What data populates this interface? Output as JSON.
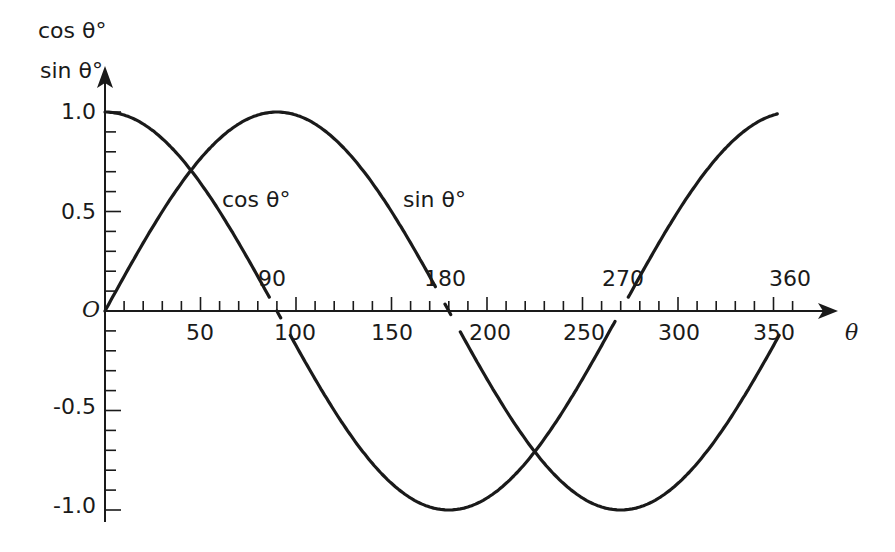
{
  "chart_data": {
    "type": "line",
    "title": "",
    "xlabel": "θ",
    "ylabel_lines": [
      "cos θ°",
      "sin θ°"
    ],
    "xlim": [
      0,
      360
    ],
    "ylim": [
      -1.0,
      1.0
    ],
    "grid": false,
    "legend": "inline curve labels",
    "x_ticks_below": [
      "50",
      "100",
      "150",
      "200",
      "250",
      "300",
      "350"
    ],
    "x_ticks_above": [
      "90",
      "180",
      "270",
      "360"
    ],
    "y_ticks": [
      "1.0",
      "0.5",
      "0",
      "-0.5",
      "-1.0"
    ],
    "origin_label": "O",
    "series": [
      {
        "name": "cos θ°",
        "x": [
          0,
          30,
          45,
          60,
          90,
          120,
          135,
          150,
          180,
          210,
          225,
          240,
          270,
          300,
          315,
          330,
          360
        ],
        "y": [
          1.0,
          0.866,
          0.707,
          0.5,
          0.0,
          -0.5,
          -0.707,
          -0.866,
          -1.0,
          -0.866,
          -0.707,
          -0.5,
          0.0,
          0.5,
          0.707,
          0.866,
          1.0
        ]
      },
      {
        "name": "sin θ°",
        "x": [
          0,
          30,
          45,
          60,
          90,
          120,
          135,
          150,
          180,
          210,
          225,
          240,
          270,
          300,
          315,
          330,
          360
        ],
        "y": [
          0.0,
          0.5,
          0.707,
          0.866,
          1.0,
          0.866,
          0.707,
          0.5,
          0.0,
          -0.5,
          -0.707,
          -0.866,
          -1.0,
          -0.866,
          -0.707,
          -0.5,
          0.0
        ]
      }
    ]
  },
  "labels": {
    "y_axis_line1": "cos θ°",
    "y_axis_line2": "sin θ°",
    "x_axis": "θ",
    "origin": "O",
    "cos_curve": "cos θ°",
    "sin_curve": "sin θ°",
    "y_ticks": {
      "p10": "1.0",
      "p05": "0.5",
      "m05": "-0.5",
      "m10": "-1.0"
    },
    "x_below": {
      "t50": "50",
      "t100": "100",
      "t150": "150",
      "t200": "200",
      "t250": "250",
      "t300": "300",
      "t350": "350"
    },
    "x_above": {
      "t90": "90",
      "t180": "180",
      "t270": "270",
      "t360": "360"
    }
  },
  "colors": {
    "ink": "#1a1a1a",
    "background": "#ffffff"
  }
}
